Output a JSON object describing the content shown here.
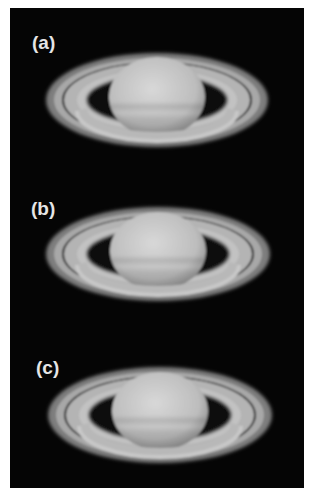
{
  "figure": {
    "background": "#050505",
    "panels": [
      {
        "label": "(a)",
        "label_pos": [
          22,
          24
        ],
        "center": [
          147,
          92
        ],
        "ring_rx": 111,
        "ring_ry": 47,
        "planet_rx": 48,
        "planet_ry": 40,
        "planet_cy_offset": -3
      },
      {
        "label": "(b)",
        "label_pos": [
          21,
          190
        ],
        "center": [
          148,
          246
        ],
        "ring_rx": 112,
        "ring_ry": 47,
        "planet_rx": 48,
        "planet_ry": 39,
        "planet_cy_offset": -3
      },
      {
        "label": "(c)",
        "label_pos": [
          26,
          349
        ],
        "center": [
          150,
          407
        ],
        "ring_rx": 112,
        "ring_ry": 48,
        "planet_rx": 48,
        "planet_ry": 39,
        "planet_cy_offset": -4
      }
    ],
    "colors": {
      "ring_outer": "#8a8a8a",
      "ring_inner": "#c4c4c4",
      "cassini_division": "#1a1a1a",
      "planet": "#c8c8c8",
      "label": "#e6e6e6"
    }
  }
}
